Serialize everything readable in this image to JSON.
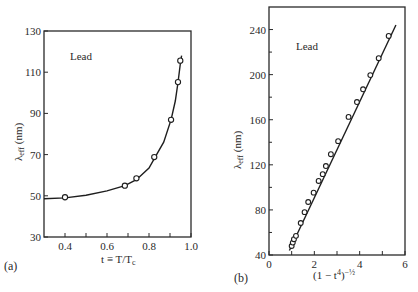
{
  "chart_data": [
    {
      "type": "scatter",
      "panel_label": "(a)",
      "annotation": "Lead",
      "title": "",
      "xlabel": "t ≡ T/T",
      "xlabel_sub": "c",
      "ylabel": "λ",
      "ylabel_sub": "eff",
      "ylabel_unit": " (nm)",
      "xlim": [
        0.3,
        1.0
      ],
      "ylim": [
        30,
        130
      ],
      "xticks": [
        0.4,
        0.6,
        0.8,
        1.0
      ],
      "xtick_labels": [
        "0.4",
        "0.6",
        "0.8",
        "1.0"
      ],
      "xminor": [
        0.5,
        0.7,
        0.9
      ],
      "yticks": [
        30,
        50,
        70,
        90,
        110,
        130
      ],
      "ytick_labels": [
        "30",
        "50",
        "70",
        "90",
        "110",
        "130"
      ],
      "grid": false,
      "series": [
        {
          "name": "Lead data",
          "marker": "open-circle",
          "x": [
            0.4,
            0.685,
            0.74,
            0.825,
            0.905,
            0.938,
            0.949
          ],
          "y": [
            49.3,
            54.9,
            58.5,
            68.8,
            86.9,
            105.2,
            115.6
          ]
        }
      ],
      "fit_curve": {
        "name": "fit",
        "x": [
          0.3,
          0.4,
          0.5,
          0.6,
          0.685,
          0.74,
          0.8,
          0.825,
          0.87,
          0.905,
          0.925,
          0.938,
          0.949,
          0.955
        ],
        "y": [
          48.6,
          49.0,
          50.3,
          52.4,
          54.9,
          57.8,
          63.5,
          68.0,
          76.0,
          87.0,
          96.0,
          105.0,
          114.0,
          118.0
        ]
      }
    },
    {
      "type": "scatter",
      "panel_label": "(b)",
      "annotation": "Lead",
      "title": "",
      "xlabel": "(1 − t",
      "xlabel_sup": "4",
      "xlabel_tail": ")",
      "xlabel_exp": "−½",
      "ylabel": "λ",
      "ylabel_sub": "eff",
      "ylabel_unit": " (nm)",
      "xlim": [
        0,
        6
      ],
      "ylim": [
        40,
        260
      ],
      "xticks": [
        0,
        2,
        4,
        6
      ],
      "xtick_labels": [
        "0",
        "2",
        "4",
        "6"
      ],
      "xminor": [
        1,
        3,
        5
      ],
      "yticks": [
        40,
        80,
        120,
        160,
        200,
        240
      ],
      "ytick_labels": [
        "40",
        "80",
        "120",
        "160",
        "200",
        "240"
      ],
      "yminor": [
        60,
        100,
        140,
        180,
        220
      ],
      "grid": false,
      "series": [
        {
          "name": "Lead data",
          "marker": "open-circle",
          "x": [
            1.0,
            1.05,
            1.1,
            1.19,
            1.4,
            1.57,
            1.73,
            1.97,
            2.19,
            2.37,
            2.51,
            2.73,
            3.05,
            3.51,
            3.88,
            4.15,
            4.47,
            4.84,
            5.28
          ],
          "y": [
            48,
            51,
            54,
            57,
            68.4,
            78,
            87,
            95.3,
            105.7,
            111.7,
            118.9,
            129.4,
            141,
            162.5,
            175.7,
            187,
            199.6,
            214.6,
            234.3
          ]
        }
      ],
      "fit_line": {
        "name": "linear fit",
        "x": [
          0.9,
          5.6
        ],
        "y": [
          44,
          244
        ]
      }
    }
  ]
}
